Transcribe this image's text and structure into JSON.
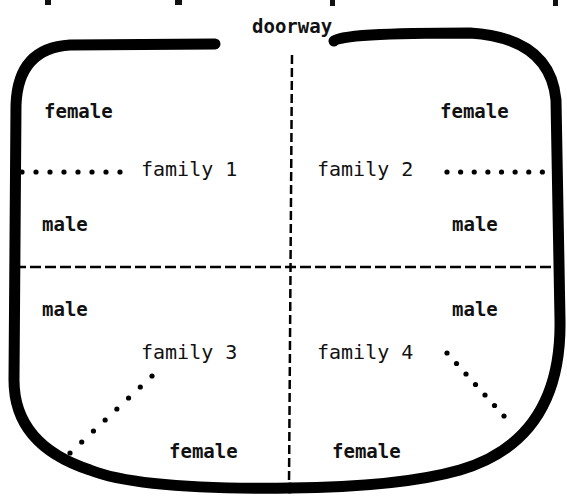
{
  "diagram": {
    "title_cut_off": "",
    "doorway_label": "doorway",
    "divider_style": "dashed",
    "wall_color": "#000000",
    "families": [
      {
        "id": 1,
        "label": "family 1",
        "top_label": "female",
        "bottom_label": "male",
        "link_style": "dotted"
      },
      {
        "id": 2,
        "label": "family 2",
        "top_label": "female",
        "bottom_label": "male",
        "link_style": "dotted"
      },
      {
        "id": 3,
        "label": "family 3",
        "top_label": "male",
        "bottom_label": "female",
        "link_style": "dotted"
      },
      {
        "id": 4,
        "label": "family 4",
        "top_label": "male",
        "bottom_label": "female",
        "link_style": "dotted"
      }
    ]
  }
}
